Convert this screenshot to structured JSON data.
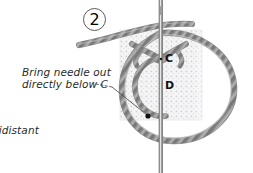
{
  "diagram": {
    "step_number": "2",
    "caption": {
      "line_1": "Bring needle out",
      "line_2": "directly below C"
    },
    "clipped_text": "uidistant",
    "point_labels": {
      "c": "C",
      "d": "D"
    },
    "icons": {
      "needle": "sewing-needle-icon",
      "thread_loop": "thread-loop-icon",
      "thread_tail": "thread-tail-icon",
      "knot": "knot-icon",
      "fabric": "aida-fabric-swatch-icon",
      "leader": "dotted-leader-line-icon",
      "exit_point": "needle-exit-point-dot-icon"
    },
    "colors": {
      "background": "#ffffff",
      "thread": "#8e8e8e",
      "thread_dark": "#6f6f6f",
      "thread_light": "#c0c0c0",
      "needle": "#a9a9a9",
      "needle_edge": "#7c7c7c",
      "fabric": "#f3f3f3",
      "fabric_dot": "#c8c8cf",
      "text": "#2b2b2b",
      "label": "#131313",
      "badge_border": "#5b5b5b",
      "leader": "#4a4a4a",
      "dot": "#111111"
    },
    "geometry": {
      "fabric_rect": {
        "x": 120,
        "y": 30,
        "w": 82,
        "h": 90
      },
      "needle_x": 161,
      "point_c": {
        "x": 161,
        "y": 58
      },
      "point_d": {
        "x": 161,
        "y": 85
      },
      "exit_dot": {
        "x": 148,
        "y": 116
      }
    }
  }
}
